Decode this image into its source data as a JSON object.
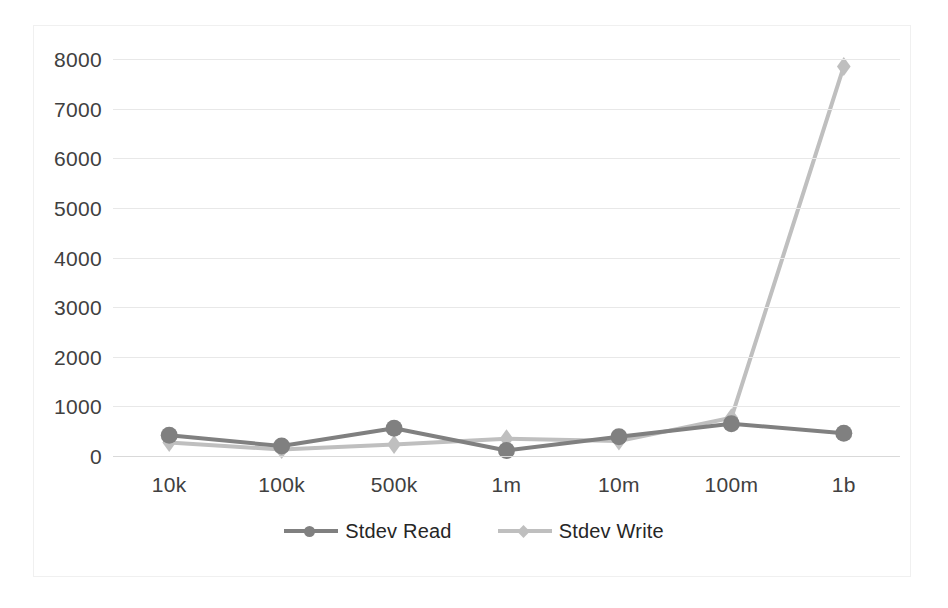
{
  "chart_data": {
    "type": "line",
    "title": "",
    "xlabel": "",
    "ylabel": "",
    "categories": [
      "10k",
      "100k",
      "500k",
      "1m",
      "10m",
      "100m",
      "1b"
    ],
    "ylim": [
      0,
      8000
    ],
    "y_ticks": [
      0,
      1000,
      2000,
      3000,
      4000,
      5000,
      6000,
      7000,
      8000
    ],
    "y_tick_labels": [
      "0",
      "1000",
      "2000",
      "3000",
      "4000",
      "5000",
      "6000",
      "7000",
      "8000"
    ],
    "grid": true,
    "legend_position": "bottom",
    "series": [
      {
        "name": "Stdev Read",
        "color": "#808080",
        "marker": "circle",
        "values": [
          420,
          200,
          560,
          110,
          390,
          650,
          460
        ]
      },
      {
        "name": "Stdev Write",
        "color": "#bfbfbf",
        "marker": "diamond",
        "values": [
          270,
          130,
          230,
          350,
          300,
          770,
          7850
        ]
      }
    ]
  },
  "legend": {
    "entries": [
      {
        "label": "Stdev Read"
      },
      {
        "label": "Stdev Write"
      }
    ]
  },
  "colors": {
    "series_read": "#808080",
    "series_write": "#bfbfbf",
    "gridline": "#e8e8e8",
    "axis": "#d9d9d9",
    "tick_text": "#404040",
    "legend_text": "#262626",
    "frame": "#f0f0f0",
    "background": "#ffffff"
  }
}
